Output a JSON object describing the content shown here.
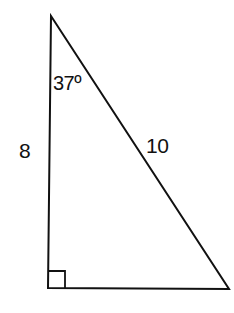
{
  "diagram": {
    "type": "right-triangle",
    "colors": {
      "stroke": "#111111",
      "background": "#ffffff",
      "text": "#111111"
    },
    "vertices": {
      "top": [
        51,
        16
      ],
      "bottom_left": [
        48,
        288
      ],
      "bottom_right": [
        229,
        289
      ]
    },
    "labels": {
      "angle": "37º",
      "left_side": "8",
      "hypotenuse": "10"
    },
    "right_angle_marker": {
      "at": "bottom_left",
      "size": 17
    }
  }
}
